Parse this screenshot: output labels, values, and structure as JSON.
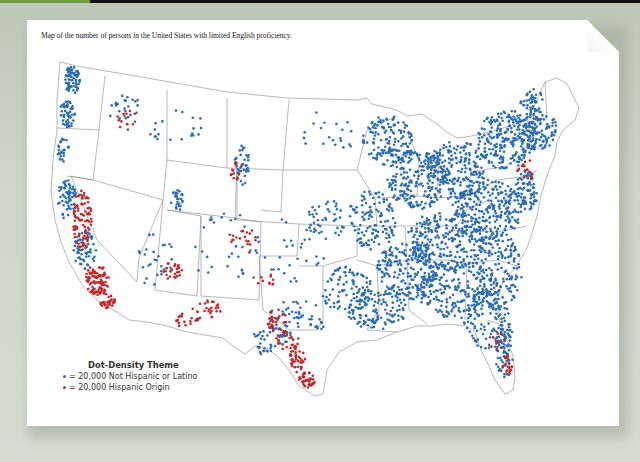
{
  "caption": "Map of the number of persons in the United States with limited English proficiency.",
  "legend": {
    "title": "Dot-Density Theme",
    "items": [
      {
        "label": "= 20,000 Not Hispanic or Latino",
        "color": "#2a6db3"
      },
      {
        "label": "= 20,000 Hispanic Origin",
        "color": "#c0292a"
      }
    ]
  },
  "colors": {
    "not_hispanic": "#2a6db3",
    "hispanic": "#c0292a",
    "border": "#777777",
    "accent_bar": "#6f9a3e"
  },
  "chart_data": {
    "type": "dot-density-map",
    "title": "Map of the number of persons in the United States with limited English proficiency.",
    "legend_title": "Dot-Density Theme",
    "dot_value": 20000,
    "series": [
      {
        "name": "Not Hispanic or Latino",
        "color": "#2a6db3",
        "density": "high in Northeast, Midwest, Great Lakes, Southeast, Pacific Northwest"
      },
      {
        "name": "Hispanic Origin",
        "color": "#c0292a",
        "density": "high in California, Texas border, Southwest, Florida"
      }
    ]
  }
}
